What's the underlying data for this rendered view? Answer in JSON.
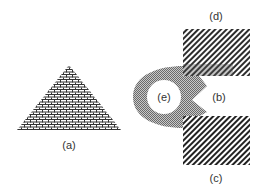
{
  "figure": {
    "labels": {
      "a": "(a)",
      "b": "(b)",
      "c": "(c)",
      "d": "(d)",
      "e": "(e)"
    },
    "shapes": [
      {
        "id": "a",
        "type": "triangle",
        "fill": "brick-pattern"
      },
      {
        "id": "b",
        "type": "notch-region",
        "fill": "white"
      },
      {
        "id": "c",
        "type": "rectangle",
        "fill": "diagonal-hatch"
      },
      {
        "id": "d",
        "type": "rectangle",
        "fill": "diagonal-hatch"
      },
      {
        "id": "e",
        "type": "circle-hole",
        "fill": "white"
      }
    ],
    "colors": {
      "background": "#ffffff",
      "pattern_ink": "#333333",
      "gray_region": "#9a9a9a"
    }
  }
}
